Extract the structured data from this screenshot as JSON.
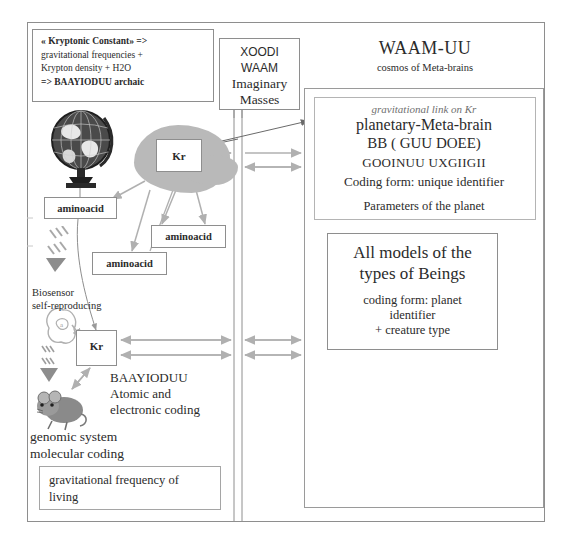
{
  "diagram": {
    "legend_box": {
      "line1": "« Kryptonic Constant» =>",
      "line2": "gravitational frequencies +",
      "line3": "Krypton density + H2O",
      "line4": "=> BAAYIODUU archaic"
    },
    "xoodi_box": {
      "line1": "XOODI",
      "line2": "WAAM",
      "line3": "Imaginary",
      "line4": "Masses"
    },
    "waam": {
      "title": "WAAM-UU",
      "subtitle": "cosmos of Meta-brains"
    },
    "planetary": {
      "grav_link": "gravitational link on Kr",
      "line1": "planetary-Meta-brain",
      "line2": "BB ( GUU DOEE)",
      "line3": "GOOINUU UXGIIGII",
      "line4": "Coding form: unique identifier",
      "parameters": "Parameters of the planet"
    },
    "models_box": {
      "title_line1": "All models of the",
      "title_line2": "types of Beings",
      "sub_line1": "coding form: planet",
      "sub_line2": "identifier",
      "sub_line3": "+ creature type"
    },
    "amino_boxes": [
      {
        "label": "aminoacid"
      },
      {
        "label": "aminoacid"
      },
      {
        "label": "aminoacid"
      }
    ],
    "kr_boxes": [
      {
        "label": "Kr"
      },
      {
        "label": "Kr"
      }
    ],
    "biosensor": {
      "line1": "Biosensor",
      "line2": "self-reproducing"
    },
    "baayioduu": {
      "line1": "BAAYIODUU",
      "line2": "Atomic and",
      "line3": "electronic coding"
    },
    "genomic": {
      "line1": "genomic system",
      "line2": "molecular coding"
    },
    "gravfreq_box": {
      "line1": "gravitational frequency of",
      "line2": "living"
    },
    "images": {
      "globe": "globe-icon",
      "mouse": "mouse-icon",
      "creature": "creature-icon",
      "biosensor_cell": "cell-icon",
      "blob": "organic-blob-shape"
    },
    "colors": {
      "arrow": "#b0b0b0",
      "line": "#8e8e8e",
      "blob": "#b9b9b9",
      "text": "#2b2b2b",
      "muted_text": "#6f6f6f"
    }
  }
}
